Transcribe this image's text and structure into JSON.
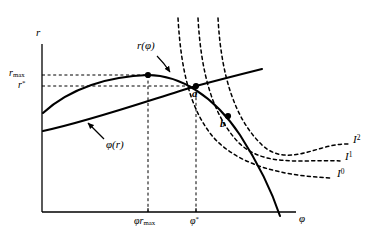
{
  "figure": {
    "background_color": "#ffffff",
    "ink_color": "#000000",
    "width": 375,
    "height": 239
  },
  "axes": {
    "y_axis": {
      "label": "r",
      "name": "vertical-axis-interest-rate"
    },
    "x_axis": {
      "label": "φ",
      "name": "horizontal-axis-phi"
    },
    "origin_px": {
      "x": 42,
      "y": 212
    },
    "x_axis_end_px": 296,
    "y_axis_top_px": 44
  },
  "y_ticks": [
    {
      "id": "r-max",
      "label_main": "r",
      "label_sub": "max",
      "y_px": 75
    },
    {
      "id": "r-star",
      "label_main": "r",
      "label_sup": "*",
      "y_px": 86
    }
  ],
  "x_ticks": [
    {
      "id": "phi-r-max",
      "label_main": "φr",
      "label_sub": "max",
      "x_px": 148
    },
    {
      "id": "phi-star",
      "label_main": "φ",
      "label_sup": "*",
      "x_px": 196
    }
  ],
  "curves": [
    {
      "id": "r-of-phi",
      "label": "r(φ)",
      "style": "solid",
      "description": "Concave interest-rate function of phi, peaks at (phi r_max, r_max) then falls and crosses the phi axis",
      "label_px": {
        "x": 137,
        "y": 44
      }
    },
    {
      "id": "phi-of-r",
      "label": "φ(r)",
      "style": "solid",
      "description": "Upward sloping near-linear loan-supply/demand schedule",
      "label_px": {
        "x": 106,
        "y": 143
      }
    }
  ],
  "indifference_curves": [
    {
      "id": "I0",
      "label_main": "I",
      "label_sup": "0",
      "label_px": {
        "x": 340,
        "y": 174
      }
    },
    {
      "id": "I1",
      "label_main": "I",
      "label_sup": "1",
      "label_px": {
        "x": 348,
        "y": 157
      }
    },
    {
      "id": "I2",
      "label_main": "I",
      "label_sup": "2",
      "label_px": {
        "x": 356,
        "y": 140
      }
    }
  ],
  "points": [
    {
      "id": "peak",
      "label": "",
      "x_px": 148,
      "y_px": 75,
      "marked": true
    },
    {
      "id": "a",
      "label": "a",
      "x_px": 196,
      "y_px": 86,
      "label_px": {
        "x": 192,
        "y": 91
      }
    },
    {
      "id": "b",
      "label": "b",
      "x_px": 228,
      "y_px": 116,
      "label_px": {
        "x": 221,
        "y": 120
      }
    }
  ],
  "dashed_guides": [
    {
      "id": "r-max-horizontal",
      "from": "y-axis",
      "to": "peak",
      "orientation": "horizontal"
    },
    {
      "id": "r-star-horizontal",
      "from": "y-axis",
      "to": "point-a",
      "orientation": "horizontal"
    },
    {
      "id": "phi-r-max-vertical",
      "from": "x-axis",
      "to": "peak",
      "orientation": "vertical"
    },
    {
      "id": "phi-star-vertical",
      "from": "x-axis",
      "to": "point-a",
      "orientation": "vertical"
    }
  ]
}
